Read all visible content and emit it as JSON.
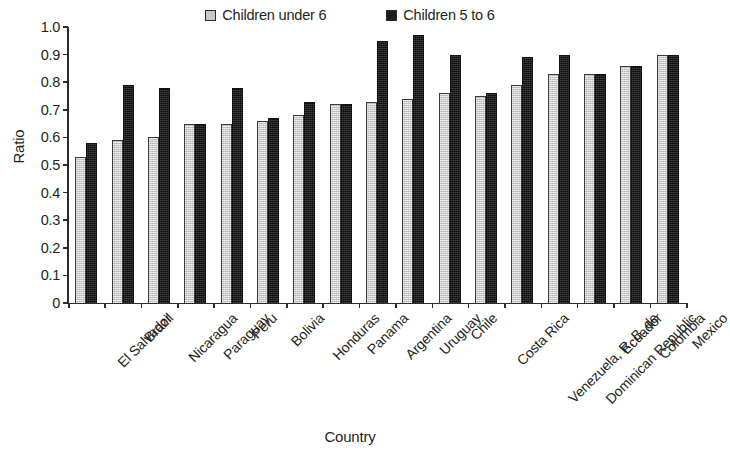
{
  "chart_data": {
    "type": "bar",
    "title": "",
    "xlabel": "Country",
    "ylabel": "Ratio",
    "ylim": [
      0,
      1.0
    ],
    "ytick_labels": [
      "1.0",
      "0.9",
      "0.8",
      "0.7",
      "0.6",
      "0.5",
      "0.4",
      "0.3",
      "0.2",
      "0.1",
      "0"
    ],
    "ytick_values": [
      1.0,
      0.9,
      0.8,
      0.7,
      0.6,
      0.5,
      0.4,
      0.3,
      0.2,
      0.1,
      0
    ],
    "grid": false,
    "legend_position": "top-center",
    "categories": [
      "El Salvador",
      "Brazil",
      "Nicaragua",
      "Paraguay",
      "Peru",
      "Bolivia",
      "Honduras",
      "Panama",
      "Argentina",
      "Uruguay",
      "Chile",
      "Costa Rica",
      "Venezuela, R. B. de",
      "Dominican Republic",
      "Ecuador",
      "Colombia",
      "Mexico"
    ],
    "series": [
      {
        "name": "Children under 6",
        "color": "#c9c9c9",
        "values": [
          0.53,
          0.59,
          0.6,
          0.65,
          0.65,
          0.66,
          0.68,
          0.72,
          0.73,
          0.74,
          0.76,
          0.75,
          0.79,
          0.83,
          0.83,
          0.86,
          0.9
        ]
      },
      {
        "name": "Children 5 to 6",
        "color": "#1b1b1b",
        "values": [
          0.58,
          0.79,
          0.78,
          0.65,
          0.78,
          0.67,
          0.73,
          0.72,
          0.95,
          0.97,
          0.9,
          0.76,
          0.89,
          0.9,
          0.83,
          0.86,
          0.9
        ]
      }
    ]
  },
  "legend": {
    "items": [
      {
        "label": "Children under 6"
      },
      {
        "label": "Children 5 to 6"
      }
    ]
  }
}
